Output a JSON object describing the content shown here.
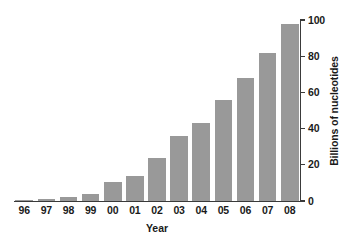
{
  "chart_data": {
    "type": "bar",
    "title": "",
    "xlabel": "Year",
    "ylabel": "Billions of nucleotides",
    "categories": [
      "96",
      "97",
      "98",
      "99",
      "00",
      "01",
      "02",
      "03",
      "04",
      "05",
      "06",
      "07",
      "08"
    ],
    "values": [
      0.3,
      1,
      2,
      4,
      10.5,
      14,
      24,
      36,
      43,
      56,
      68,
      82,
      98
    ],
    "ylim": [
      0,
      100
    ],
    "yticks": [
      0,
      20,
      40,
      60,
      80,
      100
    ],
    "ytick_labels": [
      "0",
      "20",
      "40",
      "60",
      "80",
      "100"
    ],
    "grid": false,
    "legend": null,
    "y_axis_position": "right",
    "bar_color": "#999999",
    "axis_color": "#3a3a3a",
    "text_color": "#1a1a1a",
    "background_color": "#ffffff"
  }
}
